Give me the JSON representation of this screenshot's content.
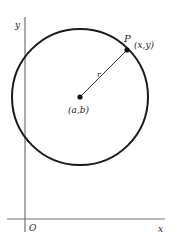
{
  "diagram": {
    "axes": {
      "x_label": "x",
      "y_label": "y",
      "origin_label": "O"
    },
    "circle": {
      "center_label": "(a,b)",
      "radius_label": "r"
    },
    "point": {
      "name_label": "P",
      "coord_label": "(x,y)"
    },
    "colors": {
      "stroke": "#1a1a1a",
      "axis": "#444444",
      "text": "#222222"
    }
  }
}
